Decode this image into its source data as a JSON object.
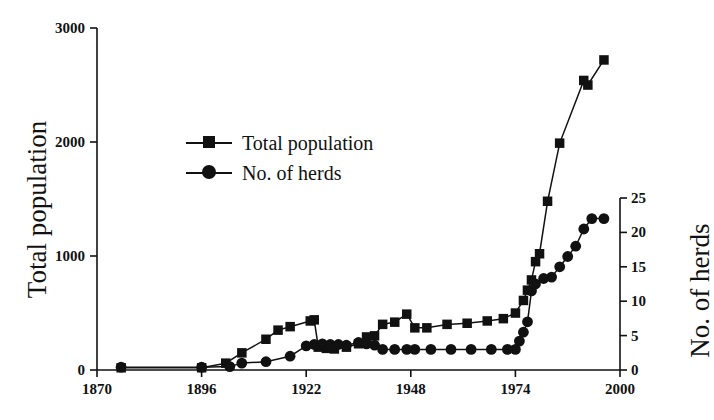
{
  "chart_data": {
    "type": "line",
    "title": "",
    "xlabel": "",
    "ylabel": "Total population",
    "y2label": "No. of herds",
    "xlim": [
      1870,
      2000
    ],
    "ylim": [
      0,
      3000
    ],
    "y2lim": [
      0,
      25
    ],
    "grid": false,
    "legend_position": "upper-left-inside",
    "x_ticks": [
      "1870",
      "1896",
      "1922",
      "1948",
      "1974",
      "2000"
    ],
    "x_tick_values": [
      1870,
      1896,
      1922,
      1948,
      1974,
      2000
    ],
    "y_ticks": [
      "0",
      "1000",
      "2000",
      "3000"
    ],
    "y_tick_values": [
      0,
      1000,
      2000,
      3000
    ],
    "y2_ticks": [
      "0",
      "5",
      "10",
      "15",
      "20",
      "25"
    ],
    "y2_tick_values": [
      0,
      5,
      10,
      15,
      20,
      25
    ],
    "series": [
      {
        "name": "Total population",
        "marker": "square",
        "axis": "left",
        "points": [
          [
            1876,
            20
          ],
          [
            1896,
            20
          ],
          [
            1902,
            60
          ],
          [
            1906,
            150
          ],
          [
            1912,
            270
          ],
          [
            1915,
            350
          ],
          [
            1918,
            380
          ],
          [
            1923,
            430
          ],
          [
            1924,
            440
          ],
          [
            1925,
            200
          ],
          [
            1927,
            190
          ],
          [
            1929,
            185
          ],
          [
            1932,
            200
          ],
          [
            1935,
            230
          ],
          [
            1937,
            290
          ],
          [
            1939,
            300
          ],
          [
            1941,
            400
          ],
          [
            1944,
            420
          ],
          [
            1947,
            490
          ],
          [
            1949,
            370
          ],
          [
            1952,
            370
          ],
          [
            1957,
            400
          ],
          [
            1962,
            410
          ],
          [
            1967,
            430
          ],
          [
            1971,
            450
          ],
          [
            1974,
            500
          ],
          [
            1976,
            610
          ],
          [
            1977,
            700
          ],
          [
            1978,
            790
          ],
          [
            1979,
            950
          ],
          [
            1980,
            1020
          ],
          [
            1982,
            1480
          ],
          [
            1985,
            1990
          ],
          [
            1991,
            2540
          ],
          [
            1992,
            2500
          ],
          [
            1996,
            2720
          ]
        ]
      },
      {
        "name": "No. of herds",
        "marker": "circle",
        "axis": "right",
        "points": [
          [
            1876,
            0.4
          ],
          [
            1896,
            0.4
          ],
          [
            1903,
            0.5
          ],
          [
            1906,
            1.0
          ],
          [
            1912,
            1.2
          ],
          [
            1918,
            2.0
          ],
          [
            1922,
            3.5
          ],
          [
            1924,
            3.7
          ],
          [
            1926,
            3.8
          ],
          [
            1928,
            3.7
          ],
          [
            1930,
            3.7
          ],
          [
            1932,
            3.6
          ],
          [
            1935,
            4.0
          ],
          [
            1937,
            3.8
          ],
          [
            1939,
            3.6
          ],
          [
            1941,
            3.0
          ],
          [
            1944,
            3.0
          ],
          [
            1947,
            3.0
          ],
          [
            1949,
            3.0
          ],
          [
            1953,
            3.0
          ],
          [
            1958,
            3.0
          ],
          [
            1963,
            3.0
          ],
          [
            1968,
            3.0
          ],
          [
            1972,
            3.0
          ],
          [
            1974,
            3.0
          ],
          [
            1975,
            4.2
          ],
          [
            1976,
            5.5
          ],
          [
            1977,
            7.0
          ],
          [
            1978,
            11.5
          ],
          [
            1979,
            12.5
          ],
          [
            1981,
            13.3
          ],
          [
            1983,
            13.5
          ],
          [
            1985,
            15.0
          ],
          [
            1987,
            16.5
          ],
          [
            1989,
            18.0
          ],
          [
            1991,
            20.5
          ],
          [
            1993,
            22.0
          ],
          [
            1996,
            22.0
          ]
        ]
      }
    ],
    "legend": [
      {
        "label": "Total population",
        "marker": "square"
      },
      {
        "label": "No. of herds",
        "marker": "circle"
      }
    ]
  }
}
